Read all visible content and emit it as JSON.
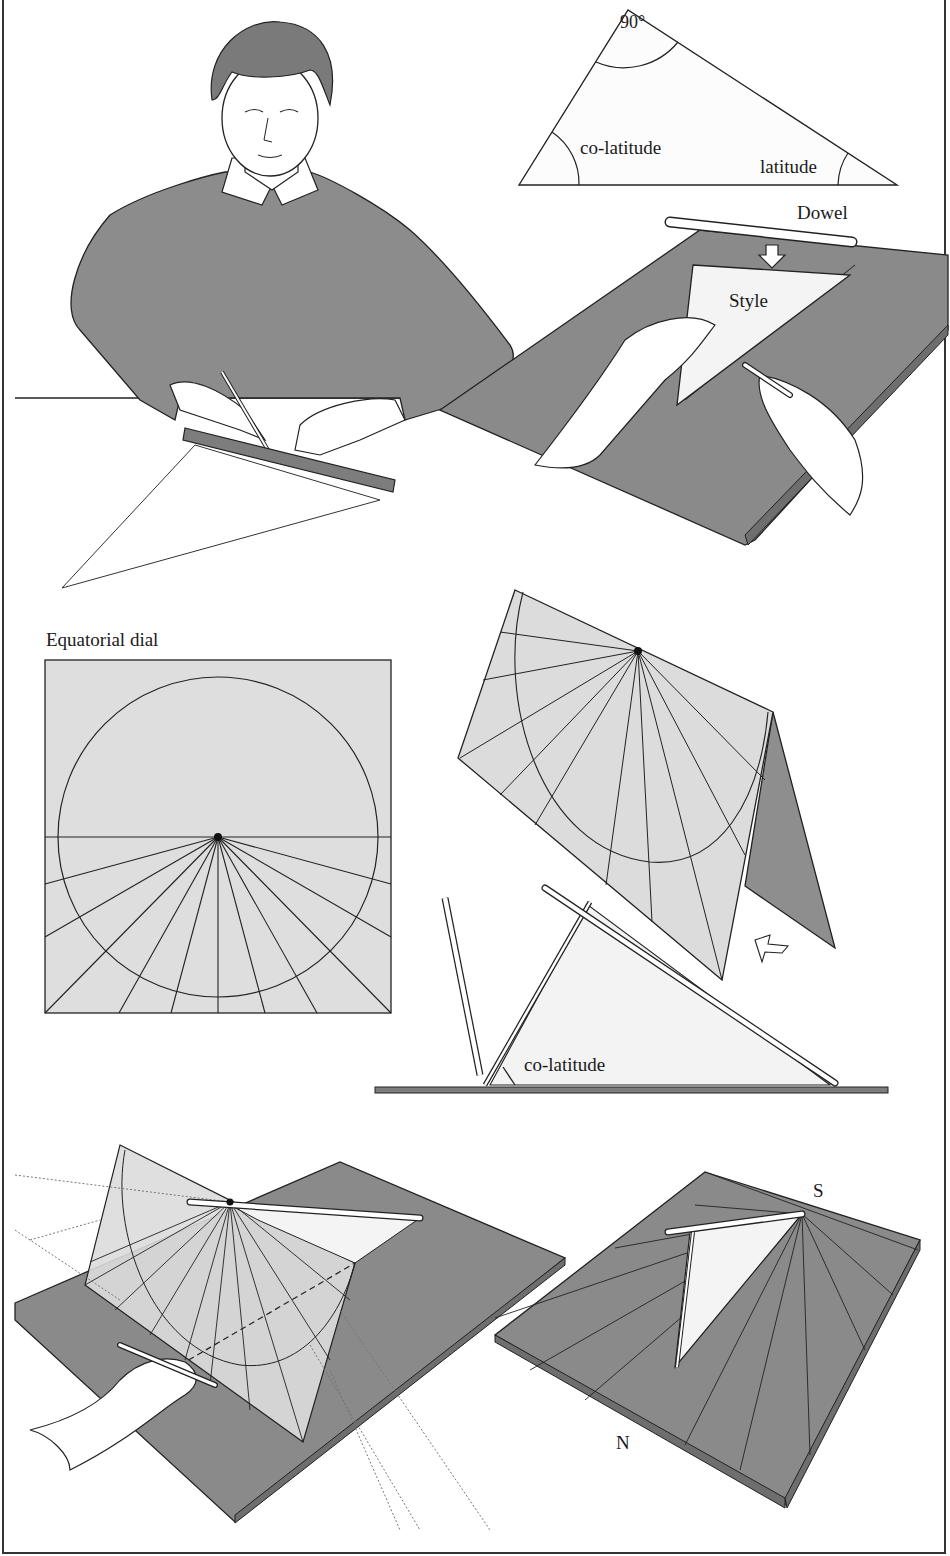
{
  "figure": {
    "colors": {
      "board": "#8a8a8a",
      "board_edge": "#6e6e6e",
      "dial_card": "#dcdcdc",
      "style_card": "#f3f3f3",
      "line": "#1e1e1e",
      "skin": "#ffffff",
      "sweater": "#8c8c8c"
    }
  },
  "panel_triangle": {
    "angle_top": "90°",
    "angle_left": "co-latitude",
    "angle_right": "latitude"
  },
  "panel_style": {
    "dowel_label": "Dowel",
    "style_label": "Style"
  },
  "panel_equatorial": {
    "title": "Equatorial dial",
    "hour_lines": 13
  },
  "panel_folding": {
    "angle_label": "co-latitude"
  },
  "panel_finished": {
    "south_label": "S",
    "north_label": "N"
  }
}
